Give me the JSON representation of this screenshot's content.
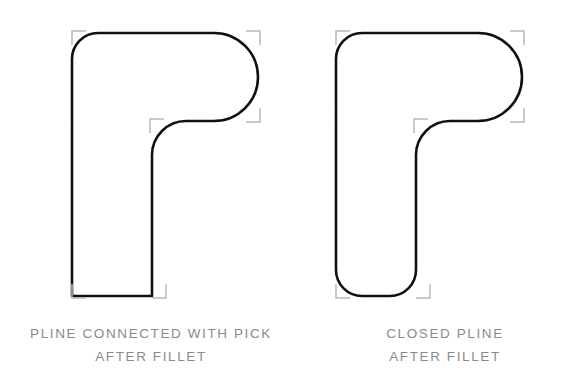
{
  "document": {
    "title": "Fillet comparison of connected pline vs closed pline",
    "background_color": "#ffffff",
    "outline_color": "#111111",
    "grip_marker_color": "#b8b8b8",
    "caption_color": "#8a8a8a"
  },
  "figures": [
    {
      "id": "figure-left",
      "name": "pline-connected-with-pick",
      "caption": {
        "line1": "PLINE CONNECTED WITH PICK",
        "line2": "AFTER FILLET"
      },
      "description": "Rounded L / r-shaped polyline with all corners filleted except the bottom-left corner, which remains a sharp 90 degree corner",
      "geometry": {
        "bounds": {
          "x": 72,
          "y": 33,
          "width": 186,
          "height": 263
        },
        "corner_radii": {
          "top_left": 26,
          "top_right": 44,
          "inner_concave": 26,
          "arm_bottom_right": 34,
          "stem_bottom_right": 26,
          "bottom_left": 0
        }
      },
      "grip_markers": [
        {
          "name": "grip-top-left",
          "x": 72,
          "y": 33,
          "corner": "tl"
        },
        {
          "name": "grip-top-right",
          "x": 258,
          "y": 33,
          "corner": "tr"
        },
        {
          "name": "grip-arm-bottom-right",
          "x": 258,
          "y": 119,
          "corner": "br"
        },
        {
          "name": "grip-inner-notch",
          "x": 152,
          "y": 119,
          "corner": "tl"
        },
        {
          "name": "grip-stem-bottom-right",
          "x": 166,
          "y": 296,
          "corner": "br"
        },
        {
          "name": "grip-bottom-left",
          "x": 72,
          "y": 296,
          "corner": "bl"
        }
      ]
    },
    {
      "id": "figure-right",
      "name": "closed-pline",
      "caption": {
        "line1": "CLOSED PLINE",
        "line2": "AFTER FILLET"
      },
      "description": "Rounded L / r-shaped closed polyline with every corner filleted, including the bottom-left corner",
      "geometry": {
        "bounds": {
          "x": 336,
          "y": 33,
          "width": 186,
          "height": 263
        },
        "corner_radii": {
          "top_left": 26,
          "top_right": 44,
          "inner_concave": 26,
          "arm_bottom_right": 34,
          "stem_bottom_right": 26,
          "bottom_left": 26
        }
      },
      "grip_markers": [
        {
          "name": "grip-top-left",
          "x": 336,
          "y": 33,
          "corner": "tl"
        },
        {
          "name": "grip-top-right",
          "x": 522,
          "y": 33,
          "corner": "tr"
        },
        {
          "name": "grip-arm-bottom-right",
          "x": 522,
          "y": 119,
          "corner": "br"
        },
        {
          "name": "grip-inner-notch",
          "x": 416,
          "y": 119,
          "corner": "tl"
        },
        {
          "name": "grip-stem-bottom-right",
          "x": 430,
          "y": 296,
          "corner": "br"
        },
        {
          "name": "grip-bottom-left",
          "x": 336,
          "y": 296,
          "corner": "bl"
        }
      ]
    }
  ]
}
